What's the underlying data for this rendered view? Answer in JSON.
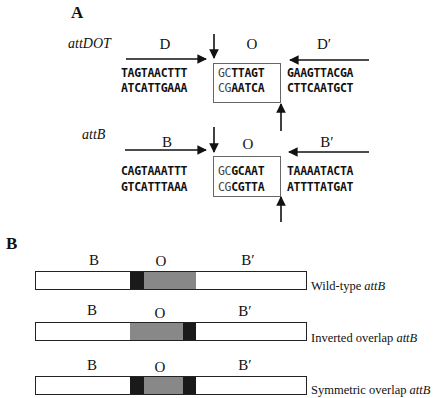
{
  "panel_a": {
    "label": "A",
    "attDOT": {
      "name": "attDOT",
      "left_region": "D",
      "core_region": "O",
      "right_region": "D′",
      "top_left": "TAGTAACTTT",
      "top_core_thin": "GC",
      "top_core_bold": "TTAGT",
      "top_right": "GAAGTTACGA",
      "bottom_left": "ATCATTGAAA",
      "bottom_core_thin": "CG",
      "bottom_core_bold": "AATCA",
      "bottom_right": "CTTCAATGCT"
    },
    "attB": {
      "name": "attB",
      "left_region": "B",
      "core_region": "O",
      "right_region": "B′",
      "top_left": "CAGTAAATTT",
      "top_core_thin": "GC",
      "top_core_bold": "GCAAT",
      "top_right": "TAAAATACTA",
      "bottom_left": "GTCATTTAAA",
      "bottom_core_thin": "CG",
      "bottom_core_bold": "CGTTA",
      "bottom_right": "ATTTTATGAT"
    }
  },
  "panel_b": {
    "label": "B",
    "constructs": [
      {
        "left": "B",
        "core": "O",
        "right": "B′",
        "caption_prefix": "Wild-type ",
        "caption_italic": "attB",
        "layout": "dark-left"
      },
      {
        "left": "B",
        "core": "O",
        "right": "B′",
        "caption_prefix": "Inverted overlap ",
        "caption_italic": "attB",
        "layout": "dark-right"
      },
      {
        "left": "B",
        "core": "O",
        "right": "B′",
        "caption_prefix": "Symmetric overlap ",
        "caption_italic": "attB",
        "layout": "dark-both"
      }
    ]
  },
  "colors": {
    "dark_segment": "#1a1a1a",
    "gray_segment": "#888888",
    "box_border": "#666666"
  }
}
